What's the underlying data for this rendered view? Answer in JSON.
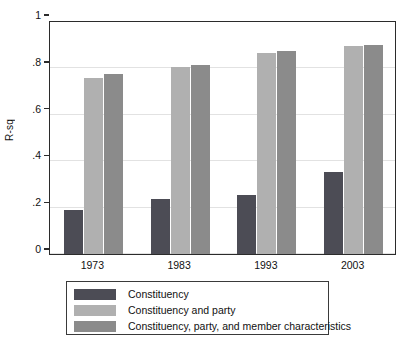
{
  "chart_data": {
    "type": "bar",
    "title": "",
    "xlabel": "",
    "ylabel": "R-sq",
    "categories": [
      "1973",
      "1983",
      "1993",
      "2003"
    ],
    "ylim": [
      0,
      1
    ],
    "yticks": [
      "0",
      ".2",
      ".4",
      ".6",
      ".8",
      "1"
    ],
    "ytick_values": [
      0,
      0.2,
      0.4,
      0.6,
      0.8,
      1
    ],
    "grid": true,
    "legend_position": "below",
    "series": [
      {
        "name": "Constituency",
        "color": "#4c4c55",
        "values": [
          0.19,
          0.235,
          0.255,
          0.355
        ]
      },
      {
        "name": "Constituency and party",
        "color": "#b0b0b0",
        "values": [
          0.76,
          0.805,
          0.865,
          0.895
        ]
      },
      {
        "name": "Constituency, party, and member characteristics",
        "color": "#8b8b8b",
        "values": [
          0.775,
          0.815,
          0.875,
          0.9
        ]
      }
    ]
  }
}
